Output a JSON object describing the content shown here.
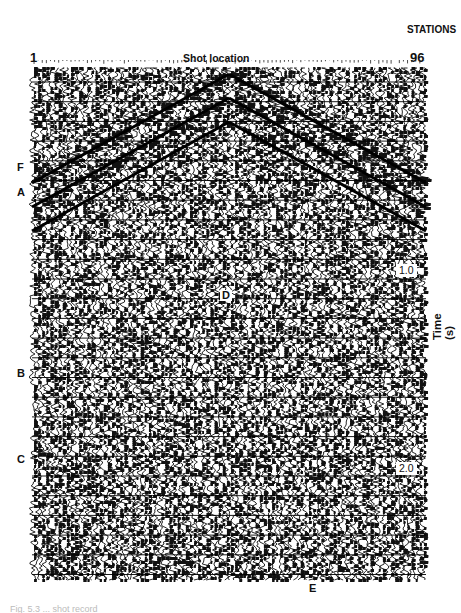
{
  "figure": {
    "stations_label": "STATIONS",
    "station_first": "1",
    "station_last": "96",
    "shot_location_label": "Shot location",
    "time_axis_label": "Time (s)",
    "time_ticks": [
      "1.0",
      "2.0"
    ],
    "event_labels": {
      "F": "F",
      "A": "A",
      "B": "B",
      "C": "C",
      "D": "D",
      "E": "E"
    },
    "caption": "Fig. 5.3  ...  shot record"
  },
  "chart_data": {
    "type": "seismic_shot_record",
    "title": "Shot location",
    "xlabel": "STATIONS",
    "ylabel": "Time (s)",
    "x_range": [
      1,
      96
    ],
    "shot_station": 48,
    "y_ticks": [
      1.0,
      2.0
    ],
    "annotations": [
      "F",
      "A",
      "B",
      "C",
      "D",
      "E"
    ],
    "colors": {
      "trace": "#111111",
      "background": "#ffffff"
    }
  }
}
